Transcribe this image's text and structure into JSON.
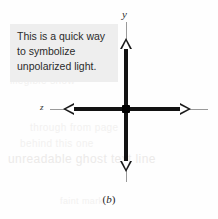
{
  "figure": {
    "caption": "(b)",
    "caption_open": "(",
    "caption_letter": "b",
    "caption_close": ")"
  },
  "callout": {
    "text": "This is a quick way to symbolize unpolarized light.",
    "background_color": "#eeeeee",
    "text_color": "#2b2b2b"
  },
  "diagram": {
    "type": "vector-axes",
    "origin_marker": "filled-square-dot",
    "origin_color": "#000000",
    "axis_color": "#121212",
    "guide_color": "#9a9a9a",
    "arrowhead_style": "hollow-triangle",
    "axes": [
      {
        "name": "vertical-axis",
        "label": "y",
        "orientation": "vertical",
        "arrowheads": 2
      },
      {
        "name": "horizontal-axis",
        "label": "z",
        "orientation": "horizontal",
        "arrowheads": 2
      }
    ]
  },
  "showthrough": {
    "line_a": "the reverse",
    "line_b": "of printed",
    "line_c": "faint bleed text",
    "line_d": "illegible show",
    "line_e": "through from page",
    "line_f": "behind this one",
    "line_g": "unreadable ghost text line",
    "line_h": "faint mark"
  }
}
